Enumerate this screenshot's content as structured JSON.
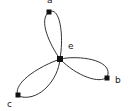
{
  "diagram": {
    "type": "graph",
    "nodes": [
      {
        "id": "a",
        "label": "a",
        "x": 49,
        "y": 12,
        "label_x": 47,
        "label_y": 3
      },
      {
        "id": "b",
        "label": "b",
        "x": 107,
        "y": 78,
        "label_x": 115,
        "label_y": 83
      },
      {
        "id": "c",
        "label": "c",
        "x": 18,
        "y": 95,
        "label_x": 7,
        "label_y": 107
      },
      {
        "id": "e",
        "label": "e",
        "x": 60,
        "y": 59,
        "label_x": 68,
        "label_y": 49
      }
    ],
    "edges": [
      {
        "from": "e",
        "to": "a",
        "shape": "loop"
      },
      {
        "from": "e",
        "to": "b",
        "shape": "loop"
      },
      {
        "from": "e",
        "to": "c",
        "shape": "loop"
      }
    ],
    "colors": {
      "stroke": "#333333",
      "node": "#111111",
      "label": "#222222"
    }
  }
}
